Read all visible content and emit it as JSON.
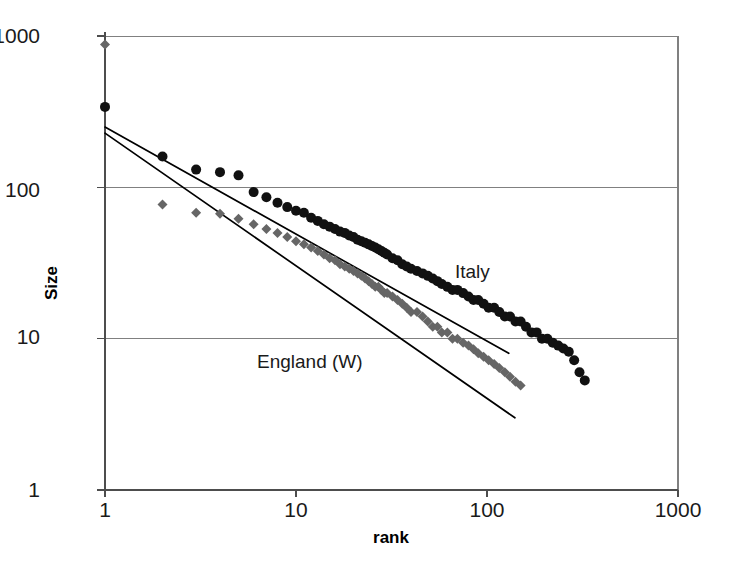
{
  "chart_data": {
    "type": "scatter",
    "title": "",
    "xlabel": "rank",
    "ylabel": "Size",
    "xscale": "log",
    "yscale": "log",
    "xlim": [
      1,
      1000
    ],
    "ylim": [
      1,
      1000
    ],
    "xticks": [
      1,
      10,
      100,
      1000
    ],
    "xtick_labels": [
      "1",
      "10",
      "100",
      "1000"
    ],
    "yticks": [
      1,
      10,
      100,
      1000
    ],
    "ytick_labels": [
      "1",
      "10",
      "100",
      "1000"
    ],
    "grid": "horizontal",
    "legend_position": "inline-annotations",
    "annotations": [
      {
        "text": "Italy",
        "x": 150,
        "y": 27
      },
      {
        "text": "England (W)",
        "x": 12,
        "y": 8.5
      }
    ],
    "series": [
      {
        "name": "Italy",
        "marker": "circle",
        "color": "#111111",
        "points": [
          [
            1,
            340
          ],
          [
            2,
            160
          ],
          [
            3,
            131
          ],
          [
            4,
            126
          ],
          [
            5,
            120
          ],
          [
            6,
            93
          ],
          [
            7,
            86
          ],
          [
            8,
            79
          ],
          [
            9,
            74
          ],
          [
            10,
            70
          ],
          [
            11,
            68
          ],
          [
            12,
            63
          ],
          [
            13,
            60
          ],
          [
            14,
            57
          ],
          [
            15,
            55
          ],
          [
            16,
            53
          ],
          [
            17,
            51
          ],
          [
            18,
            50
          ],
          [
            19,
            48
          ],
          [
            20,
            47
          ],
          [
            21,
            45
          ],
          [
            22,
            44
          ],
          [
            23,
            43
          ],
          [
            24,
            42
          ],
          [
            25,
            41
          ],
          [
            26,
            40
          ],
          [
            27,
            39
          ],
          [
            28,
            38
          ],
          [
            29,
            37
          ],
          [
            30,
            36
          ],
          [
            32,
            34
          ],
          [
            34,
            33
          ],
          [
            36,
            31
          ],
          [
            38,
            30
          ],
          [
            40,
            29
          ],
          [
            43,
            28
          ],
          [
            46,
            27
          ],
          [
            49,
            26
          ],
          [
            52,
            25
          ],
          [
            55,
            24
          ],
          [
            58,
            23
          ],
          [
            62,
            22
          ],
          [
            66,
            21
          ],
          [
            70,
            21
          ],
          [
            75,
            20
          ],
          [
            80,
            19
          ],
          [
            85,
            18
          ],
          [
            90,
            18
          ],
          [
            96,
            17
          ],
          [
            102,
            16
          ],
          [
            109,
            16
          ],
          [
            116,
            15
          ],
          [
            124,
            14
          ],
          [
            132,
            14
          ],
          [
            141,
            13
          ],
          [
            150,
            13
          ],
          [
            160,
            12
          ],
          [
            171,
            11
          ],
          [
            182,
            11
          ],
          [
            194,
            10
          ],
          [
            207,
            10
          ],
          [
            221,
            9.4
          ],
          [
            236,
            9.0
          ],
          [
            251,
            8.6
          ],
          [
            268,
            8.2
          ],
          [
            286,
            7.2
          ],
          [
            305,
            6.0
          ],
          [
            325,
            5.3
          ]
        ]
      },
      {
        "name": "England (W)",
        "marker": "diamond",
        "color": "#666666",
        "points": [
          [
            1,
            880
          ],
          [
            2,
            77
          ],
          [
            3,
            68
          ],
          [
            4,
            67
          ],
          [
            5,
            62
          ],
          [
            6,
            57
          ],
          [
            7,
            53
          ],
          [
            8,
            50
          ],
          [
            9,
            47
          ],
          [
            10,
            44
          ],
          [
            11,
            42
          ],
          [
            12,
            40
          ],
          [
            13,
            38
          ],
          [
            14,
            36
          ],
          [
            15,
            34
          ],
          [
            16,
            33
          ],
          [
            17,
            31
          ],
          [
            18,
            30
          ],
          [
            19,
            29
          ],
          [
            20,
            28
          ],
          [
            21,
            27
          ],
          [
            22,
            26
          ],
          [
            23,
            25
          ],
          [
            24,
            24
          ],
          [
            25,
            23
          ],
          [
            26,
            22
          ],
          [
            27,
            22
          ],
          [
            28,
            21
          ],
          [
            29,
            20
          ],
          [
            30,
            20
          ],
          [
            32,
            19
          ],
          [
            34,
            18
          ],
          [
            36,
            17
          ],
          [
            38,
            16
          ],
          [
            40,
            15
          ],
          [
            43,
            15
          ],
          [
            46,
            14
          ],
          [
            49,
            13
          ],
          [
            52,
            12
          ],
          [
            55,
            12
          ],
          [
            58,
            11
          ],
          [
            62,
            11
          ],
          [
            66,
            10
          ],
          [
            70,
            10
          ],
          [
            75,
            9.4
          ],
          [
            80,
            9.0
          ],
          [
            85,
            8.5
          ],
          [
            90,
            8.0
          ],
          [
            96,
            7.6
          ],
          [
            102,
            7.2
          ],
          [
            109,
            6.8
          ],
          [
            116,
            6.4
          ],
          [
            124,
            6.0
          ],
          [
            132,
            5.6
          ],
          [
            141,
            5.2
          ],
          [
            150,
            4.9
          ]
        ]
      }
    ],
    "trendlines": [
      {
        "name": "Italy-fit",
        "color": "#000000",
        "x0": 1,
        "y0": 250,
        "x1": 130,
        "y1": 8.0
      },
      {
        "name": "England-fit",
        "color": "#000000",
        "x0": 1,
        "y0": 228,
        "x1": 140,
        "y1": 3.0
      }
    ]
  },
  "axes": {
    "x_title": "rank",
    "y_title": "Size",
    "x_tick_labels": [
      "1",
      "10",
      "100",
      "1000"
    ],
    "y_tick_labels": [
      "1000",
      "100",
      "10",
      "1"
    ]
  },
  "labels": {
    "italy": "Italy",
    "england": "England (W)"
  },
  "colors": {
    "italy_marker": "#111111",
    "england_marker": "#666666",
    "trendline": "#000000",
    "gridline": "#808080",
    "axis": "#555555",
    "background": "#ffffff"
  }
}
